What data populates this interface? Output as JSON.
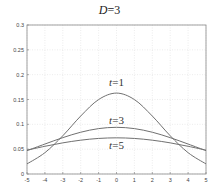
{
  "chart_data": {
    "type": "line",
    "title": "D=3",
    "title_parts": {
      "var": "D",
      "eq": "=3"
    },
    "xlabel": "",
    "ylabel": "",
    "xlim": [
      -5,
      5
    ],
    "ylim": [
      0,
      0.3
    ],
    "grid": true,
    "xticks": [
      "-5",
      "-4",
      "-3",
      "-2",
      "-1",
      "0",
      "1",
      "2",
      "3",
      "4",
      "5"
    ],
    "yticks": [
      "0",
      "0.05",
      "0.1",
      "0.15",
      "0.2",
      "0.25",
      "0.3"
    ],
    "x": [
      -5,
      -4,
      -3,
      -2,
      -1,
      0,
      1,
      2,
      3,
      4,
      5
    ],
    "series": [
      {
        "name": "t=1",
        "label_var": "t",
        "label_eq": "=1",
        "label_x": 0,
        "label_y": 0.183,
        "values": [
          0.0203,
          0.0429,
          0.077,
          0.1167,
          0.1499,
          0.1629,
          0.1499,
          0.1167,
          0.077,
          0.0429,
          0.0203
        ]
      },
      {
        "name": "t=3",
        "label_var": "t",
        "label_eq": "=3",
        "label_x": 0,
        "label_y": 0.107,
        "values": [
          0.047,
          0.0603,
          0.0732,
          0.0841,
          0.0914,
          0.094,
          0.0914,
          0.0841,
          0.0732,
          0.0603,
          0.047
        ]
      },
      {
        "name": "t=5",
        "label_var": "t",
        "label_eq": "=5",
        "label_x": 0,
        "label_y": 0.056,
        "values": [
          0.048,
          0.0558,
          0.0627,
          0.0681,
          0.0716,
          0.0728,
          0.0716,
          0.0681,
          0.0627,
          0.0558,
          0.048
        ]
      }
    ],
    "line_color": "#707070",
    "axis_color": "#8a8a8a",
    "grid_color": "#e4e4e4"
  }
}
